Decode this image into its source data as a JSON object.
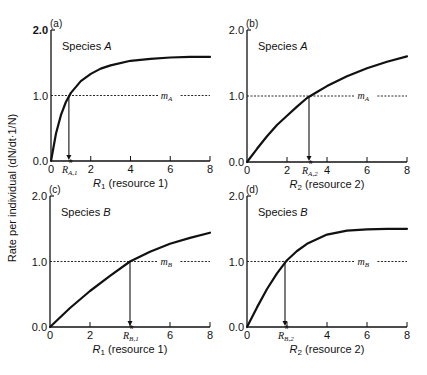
{
  "figure": {
    "ylabel": "Rate per individual (dN/dt·1/N)"
  },
  "chart_data": [
    {
      "type": "line",
      "panel": "(a)",
      "species_label": "Species A",
      "species_name": "A",
      "xlabel": "R1 (resource 1)",
      "xlabel_var": "R",
      "xlabel_sub": "1",
      "xlabel_rest": " (resource 1)",
      "xlim": [
        0,
        8
      ],
      "ylim": [
        0,
        2.0
      ],
      "xticks": [
        0,
        2,
        4,
        6,
        8
      ],
      "yticks": [
        "0.0",
        "1.0",
        "2.0"
      ],
      "mortality_label": "m",
      "mortality_sub": "A",
      "mortality_value": 1.0,
      "rstar_label": "R*",
      "rstar_sub": "A,1",
      "rstar_value": 0.9,
      "curve": {
        "x": [
          0,
          0.25,
          0.5,
          0.75,
          1,
          1.5,
          2,
          2.5,
          3,
          4,
          5,
          6,
          7,
          8
        ],
        "y": [
          0,
          0.42,
          0.7,
          0.9,
          1.04,
          1.22,
          1.33,
          1.41,
          1.46,
          1.53,
          1.56,
          1.58,
          1.59,
          1.59
        ]
      }
    },
    {
      "type": "line",
      "panel": "(b)",
      "species_label": "Species A",
      "species_name": "A",
      "xlabel": "R2 (resource 2)",
      "xlabel_var": "R",
      "xlabel_sub": "2",
      "xlabel_rest": " (resource 2)",
      "xlim": [
        0,
        8
      ],
      "ylim": [
        0,
        2.0
      ],
      "xticks": [
        0,
        2,
        4,
        6,
        8
      ],
      "yticks": [
        "0.0",
        "1.0",
        "2.0"
      ],
      "mortality_label": "m",
      "mortality_sub": "A",
      "mortality_value": 1.0,
      "rstar_label": "R*",
      "rstar_sub": "A,2",
      "rstar_value": 3.1,
      "curve": {
        "x": [
          0,
          0.5,
          1,
          1.5,
          2,
          2.5,
          3,
          3.5,
          4,
          5,
          6,
          7,
          8
        ],
        "y": [
          0,
          0.2,
          0.39,
          0.56,
          0.7,
          0.84,
          0.97,
          1.06,
          1.15,
          1.3,
          1.42,
          1.52,
          1.6
        ]
      }
    },
    {
      "type": "line",
      "panel": "(c)",
      "species_label": "Species B",
      "species_name": "B",
      "xlabel": "R1 (resource 1)",
      "xlabel_var": "R",
      "xlabel_sub": "1",
      "xlabel_rest": " (resource 1)",
      "xlim": [
        0,
        8
      ],
      "ylim": [
        0,
        2.0
      ],
      "xticks": [
        0,
        2,
        4,
        6,
        8
      ],
      "yticks": [
        "0.0",
        "1.0",
        "2.0"
      ],
      "mortality_label": "m",
      "mortality_sub": "B",
      "mortality_value": 1.0,
      "rstar_label": "R*",
      "rstar_sub": "B,1",
      "rstar_value": 4.0,
      "curve": {
        "x": [
          0,
          1,
          2,
          3,
          4,
          5,
          6,
          7,
          8
        ],
        "y": [
          0,
          0.29,
          0.55,
          0.78,
          1.0,
          1.15,
          1.27,
          1.36,
          1.44
        ]
      }
    },
    {
      "type": "line",
      "panel": "(d)",
      "species_label": "Species B",
      "species_name": "B",
      "xlabel": "R2 (resource 2)",
      "xlabel_var": "R",
      "xlabel_sub": "2",
      "xlabel_rest": " (resource 2)",
      "xlim": [
        0,
        8
      ],
      "ylim": [
        0,
        2.0
      ],
      "xticks": [
        0,
        2,
        4,
        6,
        8
      ],
      "yticks": [
        "0.0",
        "1.0",
        "2.0"
      ],
      "mortality_label": "m",
      "mortality_sub": "B",
      "mortality_value": 1.0,
      "rstar_label": "R*",
      "rstar_sub": "B,2",
      "rstar_value": 1.9,
      "curve": {
        "x": [
          0,
          0.5,
          1,
          1.5,
          2,
          2.5,
          3,
          4,
          5,
          6,
          7,
          8
        ],
        "y": [
          0,
          0.3,
          0.58,
          0.82,
          1.02,
          1.16,
          1.27,
          1.41,
          1.47,
          1.49,
          1.5,
          1.5
        ]
      }
    }
  ]
}
